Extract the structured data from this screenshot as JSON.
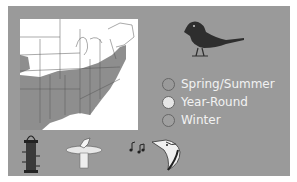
{
  "card": {
    "background": "#9a9a9a"
  },
  "map": {
    "region": "Eastern United States range map",
    "land_color": "#ffffff",
    "range_color": "#8e8e8e"
  },
  "bird_icon": "songbird-silhouette-icon",
  "legend": {
    "items": [
      {
        "label": "Spring/Summer",
        "color": "#9a9a9a"
      },
      {
        "label": "Year-Round",
        "color": "#e6e6e6"
      },
      {
        "label": "Winter",
        "color": "#a0a0a0"
      }
    ]
  },
  "bottom_icons": [
    {
      "name": "tube-feeder-icon"
    },
    {
      "name": "birdbath-icon"
    },
    {
      "name": "song-notes-icon"
    },
    {
      "name": "bird-head-icon"
    }
  ]
}
